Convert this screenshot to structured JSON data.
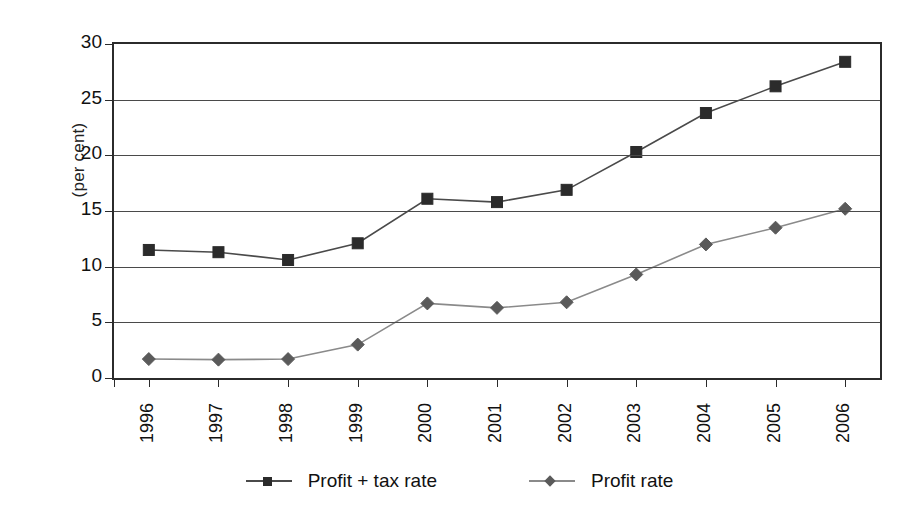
{
  "chart_data": {
    "type": "line",
    "title": "",
    "xlabel": "",
    "ylabel": "(per cent)",
    "categories": [
      "1996",
      "1997",
      "1998",
      "1999",
      "2000",
      "2001",
      "2002",
      "2003",
      "2004",
      "2005",
      "2006"
    ],
    "ylim": [
      0,
      30
    ],
    "yticks": [
      0,
      5,
      10,
      15,
      20,
      25,
      30
    ],
    "ytick_labels": [
      "0",
      "5",
      "10",
      "15",
      "20",
      "25",
      "30"
    ],
    "grid": "horizontal",
    "legend_position": "bottom-center",
    "series": [
      {
        "name": "Profit + tax rate",
        "marker": "square",
        "color": "#2b2b2b",
        "line_color": "#4a4a4a",
        "values": [
          11.5,
          11.3,
          10.6,
          12.1,
          16.1,
          15.8,
          16.9,
          20.3,
          23.8,
          26.2,
          28.4
        ]
      },
      {
        "name": "Profit rate",
        "marker": "diamond",
        "color": "#5a5a5a",
        "line_color": "#8a8a8a",
        "values": [
          1.7,
          1.65,
          1.7,
          3.0,
          6.7,
          6.3,
          6.8,
          9.3,
          12.0,
          13.5,
          15.2
        ]
      }
    ]
  },
  "legend": {
    "entries": [
      {
        "label": "Profit + tax rate",
        "marker": "square-marker-icon"
      },
      {
        "label": "Profit rate",
        "marker": "diamond-marker-icon"
      }
    ]
  }
}
